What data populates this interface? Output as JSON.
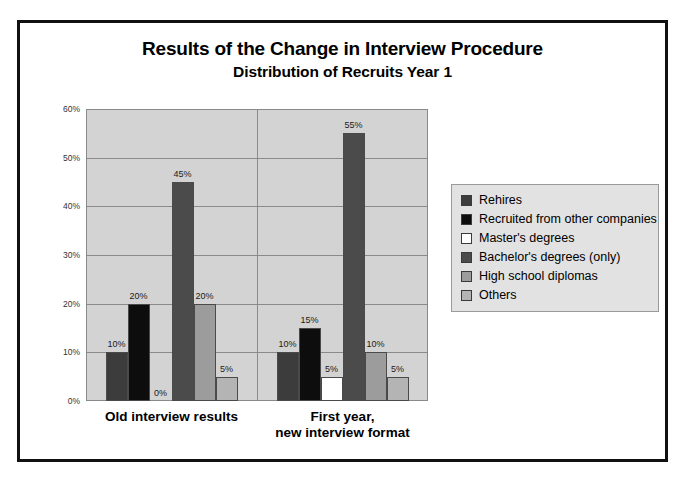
{
  "chart_data": {
    "type": "bar",
    "title": "Results of the Change in Interview Procedure",
    "subtitle": "Distribution of Recruits Year 1",
    "xlabel": "",
    "ylabel": "",
    "ylim": [
      0,
      60
    ],
    "ytick_labels": [
      "0%",
      "10%",
      "20%",
      "30%",
      "40%",
      "50%",
      "60%"
    ],
    "ytick_values": [
      0,
      10,
      20,
      30,
      40,
      50,
      60
    ],
    "grid": true,
    "legend_position": "right",
    "categories": [
      "Old interview results",
      "First year,\nnew interview format"
    ],
    "category_lines": [
      [
        "Old interview results"
      ],
      [
        "First year,",
        "new interview format"
      ]
    ],
    "series": [
      {
        "name": "Rehires",
        "color": "#3c3c3c",
        "values": [
          10,
          10
        ],
        "labels": [
          "10%",
          "10%"
        ]
      },
      {
        "name": "Recruited from other companies",
        "color": "#0d0d0d",
        "values": [
          20,
          15
        ],
        "labels": [
          "20%",
          "15%"
        ]
      },
      {
        "name": "Master's degrees",
        "color": "#ffffff",
        "values": [
          0,
          5
        ],
        "labels": [
          "0%",
          "5%"
        ]
      },
      {
        "name": "Bachelor's degrees (only)",
        "color": "#4b4b4b",
        "values": [
          45,
          55
        ],
        "labels": [
          "45%",
          "55%"
        ]
      },
      {
        "name": "High school diplomas",
        "color": "#9c9c9c",
        "values": [
          20,
          10
        ],
        "labels": [
          "20%",
          "10%"
        ]
      },
      {
        "name": "Others",
        "color": "#b4b4b4",
        "values": [
          5,
          5
        ],
        "labels": [
          "5%",
          "5%"
        ]
      }
    ]
  },
  "legend": {
    "items": [
      {
        "label": "Rehires",
        "color": "#3c3c3c"
      },
      {
        "label": "Recruited from other companies",
        "color": "#0d0d0d"
      },
      {
        "label": "Master's degrees",
        "color": "#ffffff"
      },
      {
        "label": "Bachelor's degrees (only)",
        "color": "#4b4b4b"
      },
      {
        "label": "High school diplomas",
        "color": "#9c9c9c"
      },
      {
        "label": "Others",
        "color": "#b4b4b4"
      }
    ]
  },
  "colors": {
    "frame": "#111111",
    "plot_background": "#d3d3d3",
    "gridline": "#8a8a8a",
    "legend_background": "#e2e2e2",
    "page_background": "#ffffff"
  }
}
